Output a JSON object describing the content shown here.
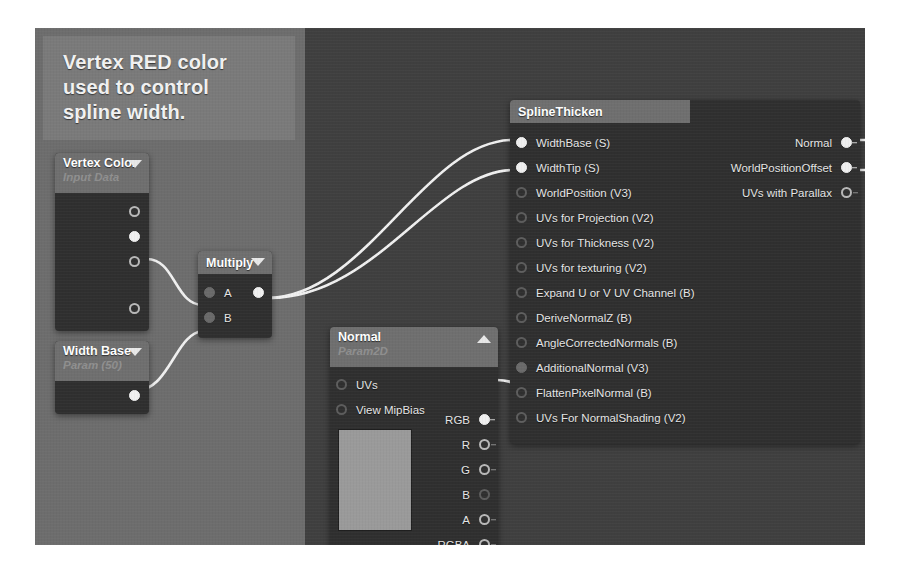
{
  "comment": {
    "text": "Vertex RED color used to control spline width.",
    "lines": [
      "Vertex RED color",
      "used to control",
      "spline width."
    ]
  },
  "colors": {
    "canvas_bg": "#4a4a4a",
    "band_light": "#6d6d6d",
    "band_dark": "#3f3f3f",
    "node_body": "#2f2f2f",
    "node_header": "#6f6f6f",
    "comment_bg": "#7a7a7a",
    "wire": "#f0f0f0",
    "pin_active": "#f0f0f0",
    "pin_inactive": "#b9b9b9",
    "label_text": "#e6e6e6"
  },
  "nodes": {
    "vertex_color": {
      "title": "Vertex Color",
      "subtitle": "Input Data",
      "collapse_icon": "chevron-down-icon",
      "outputs": [
        {
          "label": "",
          "state": "hollow"
        },
        {
          "label": "",
          "state": "filled"
        },
        {
          "label": "",
          "state": "hollow"
        },
        {
          "label": "",
          "state": "hollow"
        }
      ]
    },
    "width_base": {
      "title": "Width Base",
      "subtitle": "Param (50)",
      "collapse_icon": "chevron-down-icon",
      "outputs": [
        {
          "label": "",
          "state": "filled"
        }
      ]
    },
    "multiply": {
      "title": "Multiply",
      "collapse_icon": "chevron-down-icon",
      "inputs": [
        {
          "label": "A",
          "state": "dimfill"
        },
        {
          "label": "B",
          "state": "dimfill"
        }
      ],
      "outputs": [
        {
          "label": "",
          "state": "filled"
        }
      ]
    },
    "normal_param2d": {
      "title": "Normal",
      "subtitle": "Param2D",
      "collapse_icon": "chevron-up-icon",
      "inputs": [
        {
          "label": "UVs",
          "state": "dim"
        },
        {
          "label": "View MipBias",
          "state": "dim"
        }
      ],
      "outputs": [
        {
          "label": "RGB",
          "state": "filled"
        },
        {
          "label": "R",
          "state": "hollow"
        },
        {
          "label": "G",
          "state": "hollow"
        },
        {
          "label": "B",
          "state": "dim"
        },
        {
          "label": "A",
          "state": "hollow"
        },
        {
          "label": "RGBA",
          "state": "hollow"
        }
      ]
    },
    "spline_thicken": {
      "title": "SplineThicken",
      "inputs": [
        {
          "label": "WidthBase (S)",
          "state": "filled"
        },
        {
          "label": "WidthTip (S)",
          "state": "filled"
        },
        {
          "label": "WorldPosition (V3)",
          "state": "dim"
        },
        {
          "label": "UVs for Projection (V2)",
          "state": "dim"
        },
        {
          "label": "UVs for Thickness (V2)",
          "state": "dim"
        },
        {
          "label": "UVs for texturing (V2)",
          "state": "dim"
        },
        {
          "label": "Expand U or V UV Channel (B)",
          "state": "dim"
        },
        {
          "label": "DeriveNormalZ (B)",
          "state": "dim"
        },
        {
          "label": "AngleCorrectedNormals (B)",
          "state": "dim"
        },
        {
          "label": "AdditionalNormal (V3)",
          "state": "dimfill"
        },
        {
          "label": "FlattenPixelNormal (B)",
          "state": "dim"
        },
        {
          "label": "UVs For NormalShading (V2)",
          "state": "dim"
        }
      ],
      "outputs": [
        {
          "label": "Normal",
          "state": "filled"
        },
        {
          "label": "WorldPositionOffset",
          "state": "filled"
        },
        {
          "label": "UVs with Parallax",
          "state": "hollow"
        }
      ]
    }
  }
}
